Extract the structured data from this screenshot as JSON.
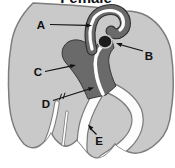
{
  "figure": {
    "title": "Female",
    "labels": {
      "a": "A",
      "b": "B",
      "c": "C",
      "d": "D",
      "e": "E"
    },
    "colors": {
      "body": "#c9c9c9",
      "body_outline": "#7d7d7d",
      "organ": "#6a6a6a",
      "organ_outline": "#2e2e2e",
      "ovary": "#1c1c1c",
      "canal": "#fdfdfd",
      "ink": "#111111"
    }
  }
}
